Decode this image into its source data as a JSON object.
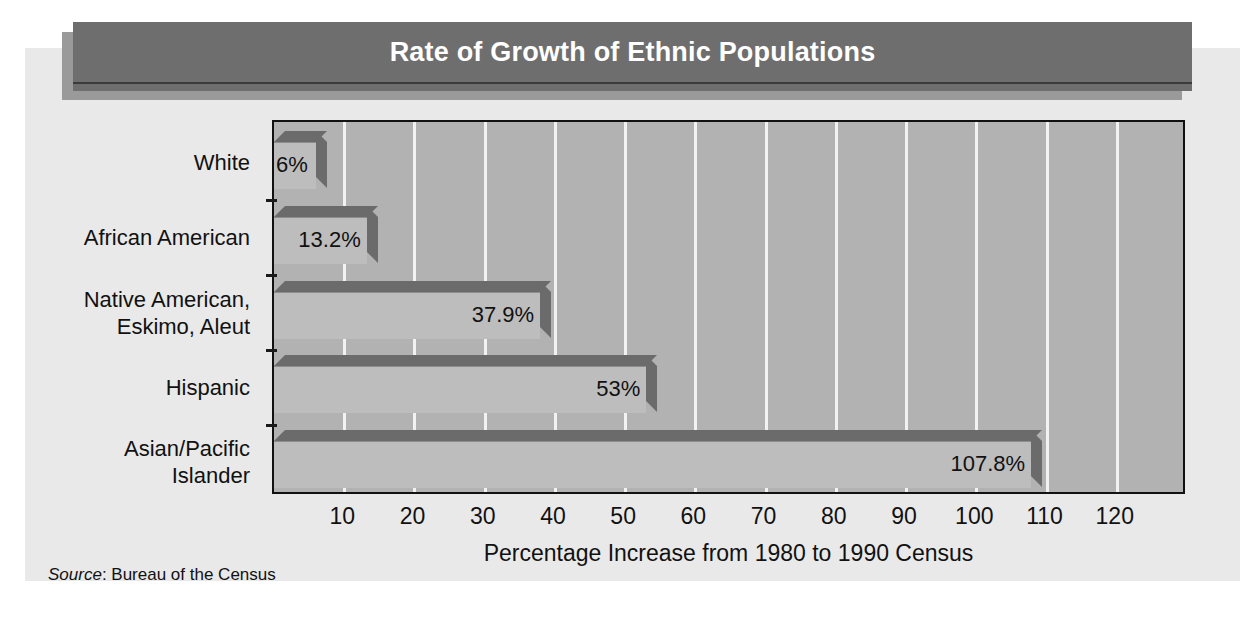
{
  "title": "Rate of Growth of Ethnic Populations",
  "source_prefix": "Source",
  "source_text": ": Bureau of the Census",
  "colors": {
    "banner": "#6e6e6e",
    "banner_shadow": "#9a9a9a",
    "panel": "#e9e9e9",
    "plot_background": "#b2b2b2",
    "gridline": "#f2f2f2",
    "bar_front": "#bdbdbd",
    "bar_shade": "#6b6b6b",
    "text": "#111111",
    "title_text": "#ffffff"
  },
  "chart_data": {
    "type": "bar",
    "orientation": "horizontal",
    "title": "Rate of Growth of Ethnic Populations",
    "xlabel": "Percentage Increase from 1980 to 1990 Census",
    "ylabel": "",
    "xlim": [
      0,
      130
    ],
    "xticks": [
      10,
      20,
      30,
      40,
      50,
      60,
      70,
      80,
      90,
      100,
      110,
      120
    ],
    "grid": true,
    "legend": "none",
    "categories": [
      "White",
      "African American",
      "Native American,\nEskimo, Aleut",
      "Hispanic",
      "Asian/Pacific\nIslander"
    ],
    "values": [
      6,
      13.2,
      37.9,
      53,
      107.8
    ],
    "value_labels": [
      "6%",
      "13.2%",
      "37.9%",
      "53%",
      "107.8%"
    ]
  }
}
